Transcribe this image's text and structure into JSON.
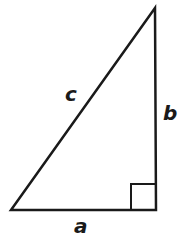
{
  "diagram": {
    "type": "right-triangle",
    "labels": {
      "hypotenuse": "c",
      "vertical_leg": "b",
      "horizontal_leg": "a"
    },
    "right_angle_marker": true,
    "stroke_color": "#1a1a1a"
  }
}
